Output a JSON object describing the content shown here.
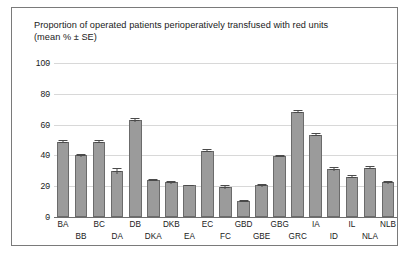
{
  "figure": {
    "title": "Proportion of operated patients perioperatively transfused with red units\n(mean % ± SE)"
  },
  "chart_data": {
    "type": "bar",
    "title": "Proportion of operated patients perioperatively transfused with red units (mean % ± SE)",
    "xlabel": "",
    "ylabel": "",
    "ylim": [
      0,
      100
    ],
    "yticks": [
      0,
      20,
      40,
      60,
      80,
      100
    ],
    "grid": true,
    "legend": "none",
    "bar_color": "#9b9b9b",
    "bar_edge_color": "#6b6b6b",
    "error_bar_color": "#4a4a4a",
    "categories": [
      "BA",
      "BB",
      "BC",
      "DA",
      "DB",
      "DKA",
      "DKB",
      "EA",
      "EC",
      "FC",
      "GBD",
      "GBE",
      "GBG",
      "GRC",
      "IA",
      "ID",
      "IL",
      "NLA",
      "NLB"
    ],
    "values": [
      49,
      40,
      49,
      30,
      63,
      24,
      22.5,
      20.5,
      43,
      19.5,
      10.5,
      20.5,
      39.5,
      68.5,
      53.5,
      31,
      26,
      32,
      22.5
    ],
    "errors": [
      1.2,
      0.8,
      1.2,
      1.8,
      1.0,
      0.8,
      0.8,
      0.6,
      1.0,
      1.0,
      0.8,
      0.8,
      0.8,
      0.8,
      0.8,
      1.2,
      1.0,
      0.8,
      0.8
    ],
    "label_rows": [
      0,
      1,
      0,
      1,
      0,
      1,
      0,
      1,
      0,
      1,
      0,
      1,
      0,
      1,
      0,
      1,
      0,
      1,
      0
    ]
  }
}
